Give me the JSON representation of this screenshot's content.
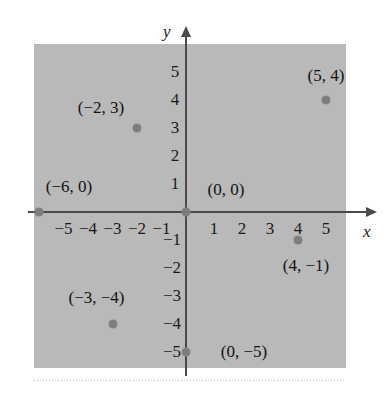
{
  "chart_data": {
    "type": "scatter",
    "title": "",
    "xlabel": "x",
    "ylabel": "y",
    "xlim": [
      -6.4,
      6.4
    ],
    "ylim": [
      -6.4,
      6.4
    ],
    "grid": true,
    "legend": "none",
    "x_ticks": [
      "-5",
      "-4",
      "-3",
      "-2",
      "-1",
      "1",
      "2",
      "3",
      "4",
      "5"
    ],
    "x_tick_values": [
      -5,
      -4,
      -3,
      -2,
      -1,
      1,
      2,
      3,
      4,
      5
    ],
    "y_ticks": [
      "5",
      "4",
      "3",
      "2",
      "1",
      "-1",
      "-2",
      "-3",
      "-4",
      "-5"
    ],
    "y_tick_values": [
      5,
      4,
      3,
      2,
      1,
      -1,
      -2,
      -3,
      -4,
      -5
    ],
    "points": [
      {
        "x": 5,
        "y": 4,
        "label": "(5, 4)",
        "label_dx": 0,
        "label_dy": -24
      },
      {
        "x": -2,
        "y": 3,
        "label": "(-2, 3)",
        "label_dx": -36,
        "label_dy": -20
      },
      {
        "x": -6,
        "y": 0,
        "label": "(-6, 0)",
        "label_dx": 30,
        "label_dy": -25
      },
      {
        "x": 0,
        "y": 0,
        "label": "(0, 0)",
        "label_dx": 40,
        "label_dy": -22
      },
      {
        "x": 4,
        "y": -1,
        "label": "(4, -1)",
        "label_dx": 8,
        "label_dy": 26
      },
      {
        "x": -3,
        "y": -4,
        "label": "(-3, -4)",
        "label_dx": -16,
        "label_dy": -26
      },
      {
        "x": 0,
        "y": -5,
        "label": "(0, -5)",
        "label_dx": 58,
        "label_dy": 0
      }
    ]
  },
  "axes": {
    "x_label": "x",
    "y_label": "y"
  },
  "colors": {
    "point": "#7d7d7d",
    "axis": "#4a4a4a",
    "grid": "#bdbdbd",
    "text": "#111111",
    "background": "#ffffff"
  }
}
